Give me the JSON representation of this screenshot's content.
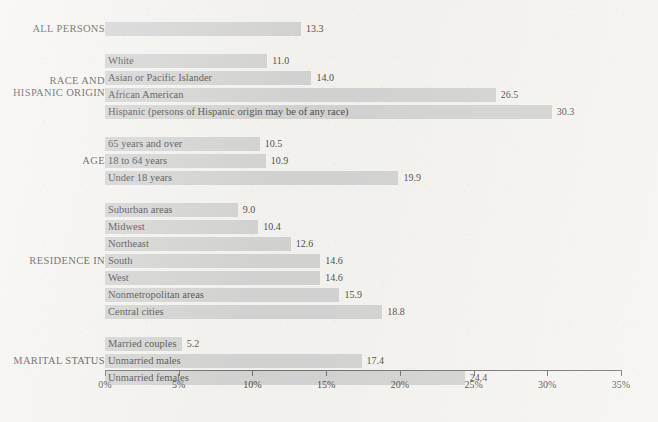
{
  "chart_data": {
    "type": "bar",
    "orientation": "horizontal",
    "title": "",
    "subtitle": "",
    "xlabel": "",
    "ylabel": "",
    "xlim": [
      0,
      35
    ],
    "grid": false,
    "legend": null,
    "value_suffix": "",
    "axis": {
      "tick_labels": [
        "0%",
        "5%",
        "10%",
        "15%",
        "20%",
        "25%",
        "30%",
        "35%"
      ],
      "tick_values": [
        0,
        5,
        10,
        15,
        20,
        25,
        30,
        35
      ]
    },
    "groups": [
      {
        "name": "ALL PERSONS",
        "bars": [
          {
            "label": "",
            "value": 13.3,
            "value_label": "13.3"
          }
        ]
      },
      {
        "name": "RACE AND\nHISPANIC ORIGIN",
        "bars": [
          {
            "label": "White",
            "value": 11.0,
            "value_label": "11.0"
          },
          {
            "label": "Asian or Pacific Islander",
            "value": 14.0,
            "value_label": "14.0"
          },
          {
            "label": "African American",
            "value": 26.5,
            "value_label": "26.5"
          },
          {
            "label": "Hispanic (persons of Hispanic origin may be of any race)",
            "value": 30.3,
            "value_label": "30.3"
          }
        ]
      },
      {
        "name": "AGE",
        "bars": [
          {
            "label": "65 years and over",
            "value": 10.5,
            "value_label": "10.5"
          },
          {
            "label": "18 to 64 years",
            "value": 10.9,
            "value_label": "10.9"
          },
          {
            "label": "Under 18 years",
            "value": 19.9,
            "value_label": "19.9"
          }
        ]
      },
      {
        "name": "RESIDENCE IN",
        "bars": [
          {
            "label": "Suburban areas",
            "value": 9.0,
            "value_label": "9.0"
          },
          {
            "label": "Midwest",
            "value": 10.4,
            "value_label": "10.4"
          },
          {
            "label": "Northeast",
            "value": 12.6,
            "value_label": "12.6"
          },
          {
            "label": "South",
            "value": 14.6,
            "value_label": "14.6"
          },
          {
            "label": "West",
            "value": 14.6,
            "value_label": "14.6"
          },
          {
            "label": "Nonmetropolitan areas",
            "value": 15.9,
            "value_label": "15.9"
          },
          {
            "label": "Central cities",
            "value": 18.8,
            "value_label": "18.8"
          }
        ]
      },
      {
        "name": "MARITAL STATUS",
        "bars": [
          {
            "label": "Married couples",
            "value": 5.2,
            "value_label": "5.2"
          },
          {
            "label": "Unmarried males",
            "value": 17.4,
            "value_label": "17.4"
          },
          {
            "label": "Unmarried females",
            "value": 24.4,
            "value_label": "24.4"
          }
        ]
      }
    ],
    "colors": {
      "bar_fill": "#c8c8c8",
      "background": "#f3f1ed",
      "axis": "#4a4a4a",
      "text": "#141414"
    }
  }
}
